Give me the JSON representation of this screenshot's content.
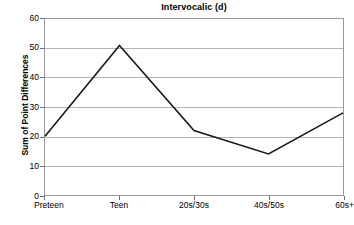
{
  "chart_data": {
    "type": "line",
    "title": "Intervocalic (d)",
    "xlabel": "",
    "ylabel": "Sum of Point Differences",
    "categories": [
      "Preteen",
      "Teen",
      "20s/30s",
      "40s/50s",
      "60s+"
    ],
    "values": [
      20,
      51,
      22,
      14,
      28
    ],
    "series": [
      {
        "name": "Sum of Point Differences",
        "values": [
          20,
          51,
          22,
          14,
          28
        ]
      }
    ],
    "ylim": [
      0,
      60
    ],
    "yticks": [
      0,
      10,
      20,
      30,
      40,
      50,
      60
    ],
    "ytick_labels": [
      "0",
      "10",
      "20",
      "30",
      "40",
      "50",
      "60"
    ],
    "grid": true,
    "grid_axis": "y",
    "legend": false,
    "legend_position": "none",
    "markers": false,
    "line_color": "#1a1a1a",
    "grid_color": "#b4b4b4",
    "frame_color": "#9a9a9a",
    "background_color": "#ffffff"
  }
}
